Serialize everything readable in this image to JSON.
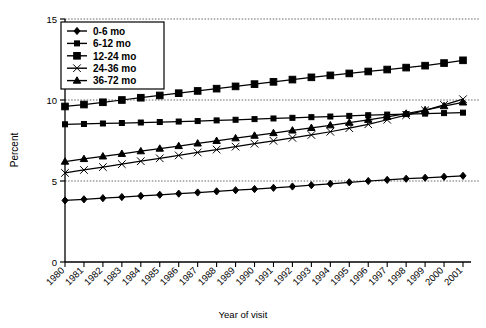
{
  "chart_data": {
    "type": "line",
    "title": "",
    "xlabel": "Year of visit",
    "ylabel": "Percent",
    "xlim": [
      1980,
      2001
    ],
    "ylim": [
      0,
      15
    ],
    "yticks": [
      0,
      5,
      10,
      15
    ],
    "ytick_labels": [
      "0",
      "5",
      "10",
      "15"
    ],
    "grid": "horizontal dotted gridlines at 5, 10 and 15",
    "legend_position": "upper left inside plot area",
    "categories": [
      "1980",
      "1981",
      "1982",
      "1983",
      "1984",
      "1985",
      "1986",
      "1987",
      "1988",
      "1989",
      "1990",
      "1991",
      "1992",
      "1993",
      "1994",
      "1995",
      "1996",
      "1997",
      "1998",
      "1999",
      "2000",
      "2001"
    ],
    "series": [
      {
        "name": "0-6 mo",
        "marker": "diamond",
        "values": [
          3.8,
          3.87,
          3.94,
          4.01,
          4.08,
          4.15,
          4.22,
          4.29,
          4.36,
          4.43,
          4.5,
          4.58,
          4.66,
          4.74,
          4.83,
          4.92,
          5.0,
          5.07,
          5.14,
          5.2,
          5.26,
          5.32
        ]
      },
      {
        "name": "6-12 mo",
        "marker": "small-square",
        "values": [
          8.5,
          8.52,
          8.55,
          8.58,
          8.61,
          8.64,
          8.67,
          8.7,
          8.74,
          8.78,
          8.82,
          8.86,
          8.9,
          8.94,
          8.98,
          9.02,
          9.06,
          9.1,
          9.13,
          9.16,
          9.19,
          9.22
        ]
      },
      {
        "name": "12-24 mo",
        "marker": "large-square",
        "values": [
          9.6,
          9.72,
          9.86,
          10.0,
          10.14,
          10.28,
          10.42,
          10.56,
          10.7,
          10.84,
          10.98,
          11.12,
          11.26,
          11.4,
          11.52,
          11.64,
          11.76,
          11.88,
          12.0,
          12.12,
          12.28,
          12.45
        ]
      },
      {
        "name": "24-36 mo",
        "marker": "cross-x",
        "values": [
          5.5,
          5.68,
          5.86,
          6.04,
          6.22,
          6.4,
          6.58,
          6.76,
          6.94,
          7.12,
          7.3,
          7.48,
          7.66,
          7.84,
          8.04,
          8.26,
          8.5,
          8.78,
          9.06,
          9.36,
          9.7,
          10.05
        ]
      },
      {
        "name": "36-72 mo",
        "marker": "triangle",
        "values": [
          6.2,
          6.36,
          6.52,
          6.68,
          6.84,
          7.0,
          7.16,
          7.32,
          7.48,
          7.64,
          7.8,
          7.96,
          8.12,
          8.28,
          8.44,
          8.6,
          8.78,
          8.96,
          9.16,
          9.38,
          9.62,
          9.85
        ]
      }
    ]
  },
  "legend": {
    "items": [
      {
        "label": "0-6 mo",
        "marker": "diamond"
      },
      {
        "label": "6-12 mo",
        "marker": "small-square"
      },
      {
        "label": "12-24 mo",
        "marker": "large-square"
      },
      {
        "label": "24-36 mo",
        "marker": "cross-x"
      },
      {
        "label": "36-72 mo",
        "marker": "triangle"
      }
    ]
  },
  "axes": {
    "y_title": "Percent",
    "x_title": "Year of visit",
    "y_tick_labels": [
      "15",
      "10",
      "5",
      "0"
    ],
    "x_tick_labels": [
      "1980",
      "1981",
      "1982",
      "1983",
      "1984",
      "1985",
      "1986",
      "1987",
      "1988",
      "1989",
      "1990",
      "1991",
      "1992",
      "1993",
      "1994",
      "1995",
      "1996",
      "1997",
      "1998",
      "1999",
      "2000",
      "2001"
    ]
  },
  "colors": {
    "line": "#000000",
    "axis": "#000000",
    "grid": "#555555",
    "background": "#ffffff"
  }
}
